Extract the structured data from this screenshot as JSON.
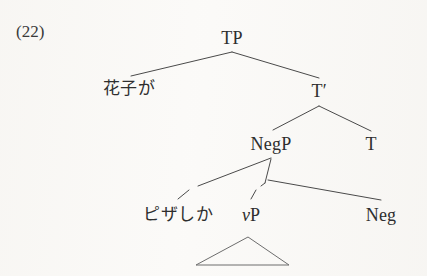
{
  "figure": {
    "example_number": "(22)",
    "background_color": "#fbfaf8",
    "ink_color": "#4a4a4a",
    "text_color": "#2e2e2e",
    "width": 427,
    "height": 276
  },
  "tree": {
    "type": "syntactic-tree",
    "nodes": [
      {
        "id": "tp",
        "label": "TP",
        "script": "latin",
        "x": 232,
        "y": 38
      },
      {
        "id": "hanako",
        "label": "花子が",
        "script": "japanese",
        "x": 129,
        "y": 90
      },
      {
        "id": "tbar",
        "label": "T",
        "prime": "′",
        "script": "latin",
        "x": 319,
        "y": 91
      },
      {
        "id": "negp",
        "label": "NegP",
        "script": "latin",
        "x": 271,
        "y": 144
      },
      {
        "id": "t",
        "label": "T",
        "script": "latin",
        "x": 371,
        "y": 144
      },
      {
        "id": "pizashika",
        "label": "ピザしか",
        "script": "japanese",
        "x": 178,
        "y": 216
      },
      {
        "id": "vp",
        "label": "vP",
        "script": "latin-italic-head",
        "x": 251,
        "y": 216
      },
      {
        "id": "neg",
        "label": "Neg",
        "script": "latin",
        "x": 381,
        "y": 216
      }
    ],
    "edges": [
      {
        "from": "tp",
        "to": "hanako"
      },
      {
        "from": "tp",
        "to": "tbar"
      },
      {
        "from": "tbar",
        "to": "negp"
      },
      {
        "from": "tbar",
        "to": "t"
      },
      {
        "from": "negp",
        "to": "pizashika"
      },
      {
        "from": "negp",
        "to": "vp"
      },
      {
        "from": "negp",
        "to": "neg"
      }
    ],
    "triangle": {
      "under": "vp",
      "apex_x": 248,
      "apex_y": 237,
      "base_left_x": 196,
      "base_right_x": 289,
      "base_y": 265
    }
  }
}
